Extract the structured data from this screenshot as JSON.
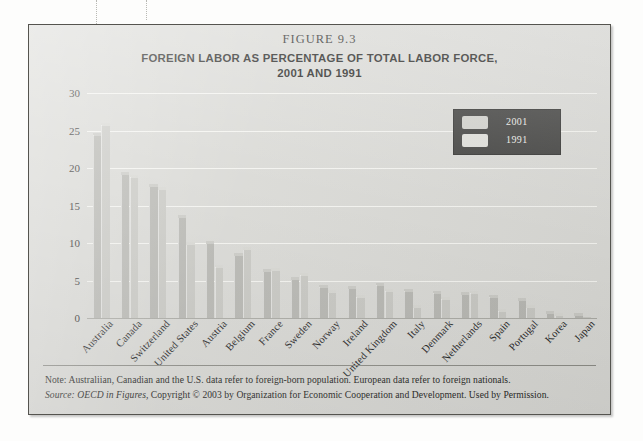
{
  "figure": {
    "number": "FIGURE 9.3",
    "title_line1": "FOREIGN LABOR AS PERCENTAGE OF TOTAL LABOR FORCE,",
    "title_line2": "2001 AND 1991"
  },
  "legend": {
    "items": [
      {
        "label": "2001",
        "color": "#cfcfca"
      },
      {
        "label": "1991",
        "color": "#dedeD9"
      }
    ],
    "background": "#3a3a38"
  },
  "footnotes": {
    "note": "Note: Australiian, Canadian and the U.S. data refer to foreign-born population. European data refer to foreign nationals.",
    "source_label": "Source:",
    "source_title": "OECD in Figures,",
    "source_rest": "Copyright © 2003 by Organization for Economic Cooperation and Development. Used by Permission."
  },
  "chart_data": {
    "type": "bar",
    "title": "FOREIGN LABOR AS PERCENTAGE OF TOTAL LABOR FORCE, 2001 AND 1991",
    "xlabel": "",
    "ylabel": "",
    "ylim": [
      0,
      30
    ],
    "yticks": [
      0,
      5,
      10,
      15,
      20,
      25,
      30
    ],
    "grid": true,
    "legend_position": "top-right",
    "categories": [
      "Australia",
      "Canada",
      "Switzerland",
      "United States",
      "Austria",
      "Belgium",
      "France",
      "Sweden",
      "Norway",
      "Ireland",
      "United Kingdom",
      "Italy",
      "Denmark",
      "Netherlands",
      "Spain",
      "Portugal",
      "Korea",
      "Japan"
    ],
    "series": [
      {
        "name": "2001",
        "color": "#b6b6b1",
        "values": [
          24.4,
          19.1,
          17.5,
          13.4,
          9.9,
          8.3,
          6.2,
          5.1,
          4.1,
          3.9,
          4.4,
          3.6,
          3.3,
          3.1,
          2.8,
          2.3,
          0.6,
          0.3
        ]
      },
      {
        "name": "1991",
        "color": "#c7c7c2",
        "values": [
          25.7,
          18.8,
          17.1,
          9.8,
          6.8,
          9.1,
          6.3,
          5.7,
          3.4,
          2.8,
          3.6,
          1.4,
          2.5,
          3.3,
          0.9,
          1.4,
          0.3,
          0.2
        ]
      }
    ]
  }
}
